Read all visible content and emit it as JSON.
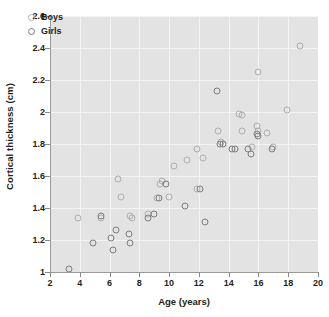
{
  "chart_data": {
    "type": "scatter",
    "title": "",
    "xlabel": "Age (years)",
    "ylabel": "Cortical thickness (cm)",
    "xlim": [
      2,
      20
    ],
    "ylim": [
      1,
      2.6
    ],
    "xticks": [
      2,
      4,
      6,
      8,
      10,
      12,
      14,
      16,
      18,
      20
    ],
    "yticks": [
      1,
      1.2,
      1.4,
      1.6,
      1.8,
      2,
      2.2,
      2.4,
      2.6
    ],
    "grid": true,
    "legend_position": "top-left",
    "series": [
      {
        "name": "Boys",
        "color": "#aeaeae",
        "points": [
          [
            3.9,
            1.34
          ],
          [
            5.4,
            1.34
          ],
          [
            6.6,
            1.58
          ],
          [
            6.8,
            1.47
          ],
          [
            7.4,
            1.35
          ],
          [
            7.5,
            1.34
          ],
          [
            8.6,
            1.36
          ],
          [
            9.2,
            1.46
          ],
          [
            9.4,
            1.55
          ],
          [
            9.5,
            1.57
          ],
          [
            10.0,
            1.47
          ],
          [
            10.3,
            1.66
          ],
          [
            11.2,
            1.7
          ],
          [
            11.9,
            1.77
          ],
          [
            11.9,
            1.52
          ],
          [
            12.3,
            1.71
          ],
          [
            13.3,
            1.88
          ],
          [
            13.5,
            1.81
          ],
          [
            14.7,
            1.99
          ],
          [
            14.9,
            1.98
          ],
          [
            14.9,
            1.88
          ],
          [
            15.6,
            1.78
          ],
          [
            15.9,
            1.91
          ],
          [
            16.0,
            1.88
          ],
          [
            16.0,
            2.25
          ],
          [
            16.6,
            1.87
          ],
          [
            17.0,
            1.78
          ],
          [
            17.9,
            2.01
          ],
          [
            18.8,
            2.41
          ]
        ]
      },
      {
        "name": "Girls",
        "color": "#7d7d7d",
        "points": [
          [
            3.3,
            1.02
          ],
          [
            4.9,
            1.18
          ],
          [
            5.4,
            1.35
          ],
          [
            6.1,
            1.21
          ],
          [
            6.2,
            1.14
          ],
          [
            6.4,
            1.26
          ],
          [
            7.3,
            1.24
          ],
          [
            7.4,
            1.18
          ],
          [
            8.6,
            1.34
          ],
          [
            9.0,
            1.36
          ],
          [
            9.3,
            1.46
          ],
          [
            9.8,
            1.55
          ],
          [
            11.1,
            1.41
          ],
          [
            12.1,
            1.52
          ],
          [
            12.4,
            1.31
          ],
          [
            13.2,
            2.13
          ],
          [
            13.4,
            1.8
          ],
          [
            13.6,
            1.8
          ],
          [
            14.2,
            1.77
          ],
          [
            14.4,
            1.77
          ],
          [
            15.3,
            1.77
          ],
          [
            15.5,
            1.74
          ],
          [
            15.9,
            1.86
          ],
          [
            16.0,
            1.85
          ],
          [
            16.9,
            1.77
          ]
        ]
      }
    ]
  },
  "legend": {
    "items": [
      {
        "label": "Boys",
        "marker": "circle-light"
      },
      {
        "label": "Girls",
        "marker": "circle-dark"
      }
    ]
  }
}
